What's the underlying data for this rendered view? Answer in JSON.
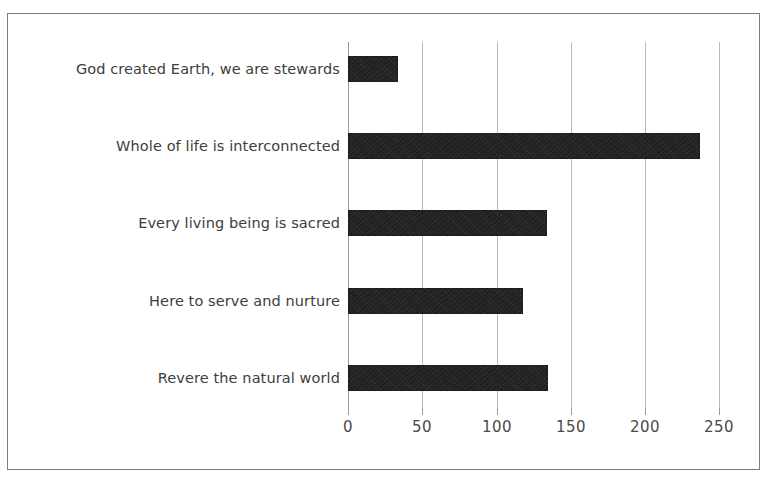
{
  "chart_data": {
    "type": "bar",
    "orientation": "horizontal",
    "title": "",
    "subtitle": "",
    "xlabel": "",
    "ylabel": "",
    "categories": [
      "God created Earth, we are stewards",
      "Whole of life is interconnected",
      "Every living being is sacred",
      "Here to serve and nurture",
      "Revere the natural world"
    ],
    "values": [
      34,
      237,
      134,
      118,
      135
    ],
    "xlim": [
      0,
      250
    ],
    "xticks": [
      0,
      50,
      100,
      150,
      200,
      250
    ],
    "xticklabels": [
      "0",
      "50",
      "100",
      "150",
      "200",
      "250"
    ],
    "grid": true,
    "grid_axis": "x",
    "legend": null,
    "bar_color": "#221f1f",
    "gridline_color": "#b9b9b9",
    "axis_color": "#9a9a9a",
    "label_color": "#3d3d3d",
    "ticklabel_color": "#4a4a4a",
    "background_color": "#ffffff",
    "border_color": "#7d7d7d"
  },
  "axis": {
    "tick_0": "0",
    "tick_50": "50",
    "tick_100": "100",
    "tick_150": "150",
    "tick_200": "200",
    "tick_250": "250"
  },
  "bars": {
    "bar_0_label": "God created Earth, we are stewards",
    "bar_1_label": "Whole of life is interconnected",
    "bar_2_label": "Every living being is sacred",
    "bar_3_label": "Here to serve and nurture",
    "bar_4_label": "Revere the natural world"
  }
}
